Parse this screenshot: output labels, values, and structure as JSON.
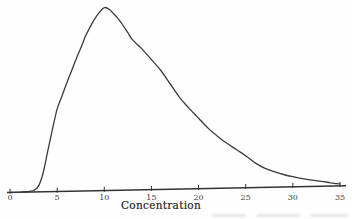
{
  "chart_data": {
    "type": "line",
    "title": "",
    "xlabel": "Concentration",
    "ylabel": "",
    "xlim": [
      0,
      35
    ],
    "xticks": [
      0,
      5,
      10,
      15,
      20,
      25,
      30,
      35
    ],
    "yaxis_shown": false,
    "grid": false,
    "legend_position": "none",
    "series": [
      {
        "name": "frequency-distribution",
        "x": [
          0,
          1,
          2,
          2.5,
          3,
          3.5,
          4,
          4.5,
          5,
          5.5,
          6,
          6.5,
          7,
          7.5,
          8,
          8.5,
          9,
          9.5,
          10,
          10.5,
          11,
          11.5,
          12,
          12.5,
          13,
          14,
          15,
          16,
          17,
          18,
          19,
          20,
          21,
          22,
          23,
          24,
          25,
          26,
          27,
          28,
          29,
          30,
          31,
          32,
          33,
          34,
          35
        ],
        "y": [
          0,
          0,
          0.004,
          0.008,
          0.03,
          0.1,
          0.22,
          0.34,
          0.45,
          0.52,
          0.59,
          0.655,
          0.72,
          0.78,
          0.845,
          0.895,
          0.94,
          0.975,
          1.0,
          0.99,
          0.965,
          0.935,
          0.9,
          0.86,
          0.82,
          0.77,
          0.71,
          0.65,
          0.575,
          0.5,
          0.44,
          0.385,
          0.33,
          0.285,
          0.245,
          0.21,
          0.175,
          0.135,
          0.105,
          0.085,
          0.068,
          0.055,
          0.044,
          0.034,
          0.027,
          0.018,
          0.011
        ]
      }
    ],
    "y_units": "relative frequency (unlabeled, no y-axis drawn)"
  },
  "style": {
    "curve_color": "#3b3b3b",
    "axis_color": "#333333",
    "tick_label_color": "#3d3d3d",
    "background": "#fefefe"
  }
}
